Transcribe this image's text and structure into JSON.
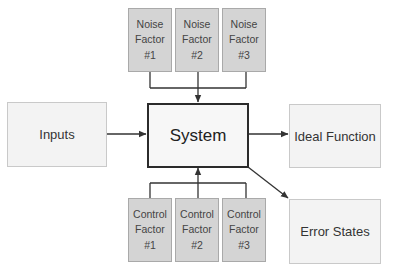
{
  "diagram": {
    "type": "P-diagram",
    "system": {
      "label": "System"
    },
    "input": {
      "label": "Inputs"
    },
    "outputs": [
      {
        "label": "Ideal Function"
      },
      {
        "label": "Error States"
      }
    ],
    "noise_factors": [
      {
        "label": "Noise\nFactor #1"
      },
      {
        "label": "Noise\nFactor #2"
      },
      {
        "label": "Noise\nFactor #3"
      }
    ],
    "control_factors": [
      {
        "label": "Control\nFactor #1"
      },
      {
        "label": "Control\nFactor #2"
      },
      {
        "label": "Control\nFactor #3"
      }
    ],
    "edges": [
      {
        "from": "Noise Factors",
        "to": "System"
      },
      {
        "from": "Inputs",
        "to": "System"
      },
      {
        "from": "System",
        "to": "Ideal Function"
      },
      {
        "from": "System",
        "to": "Error States"
      },
      {
        "from": "Control Factors",
        "to": "System"
      }
    ],
    "colors": {
      "factor_fill": "#d4d4d4",
      "io_fill": "#f3f3f3",
      "system_border": "#2b2b2b",
      "line": "#333333"
    }
  }
}
